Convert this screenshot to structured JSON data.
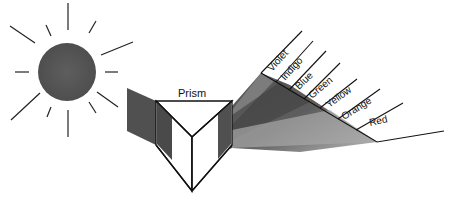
{
  "diagram": {
    "sun": {
      "label": "sun-icon",
      "color": "#5a5a5a"
    },
    "prism": {
      "label": "Prism",
      "fill": "#ffffff",
      "stroke": "#111111"
    },
    "incoming_beam": {
      "color": "#4a4a4a"
    },
    "spectrum": {
      "bands": [
        {
          "name": "Violet",
          "shade": "#7a7a7a"
        },
        {
          "name": "Indigo",
          "shade": "#5c5c5c"
        },
        {
          "name": "Blue",
          "shade": "#505050"
        },
        {
          "name": "Green",
          "shade": "#585858"
        },
        {
          "name": "Yellow",
          "shade": "#6a6a6a"
        },
        {
          "name": "Orange",
          "shade": "#8a8a8a"
        },
        {
          "name": "Red",
          "shade": "#b0b0b0"
        }
      ]
    }
  }
}
